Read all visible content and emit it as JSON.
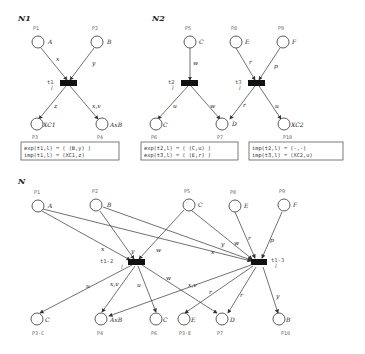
{
  "nets": {
    "n1": {
      "title": "N1",
      "places": {
        "p1": {
          "id": "P1",
          "token": "A"
        },
        "p2": {
          "id": "P2",
          "token": "B"
        },
        "p3": {
          "id": "P3",
          "token": "XC1"
        },
        "p4": {
          "id": "P4",
          "token": "AxB"
        }
      },
      "transition": {
        "id": "t1",
        "sub": "l"
      },
      "arcs": {
        "p1_t1": "x",
        "p2_t1": "y",
        "t1_p3": "z",
        "t1_p4": "x,v"
      },
      "box": {
        "line1": "exp(t1,l) = ( (B,y) )",
        "line2": "imp(t1,l) = (XC1,z)"
      }
    },
    "n2": {
      "title": "N2",
      "places": {
        "p5": {
          "id": "P5",
          "token": "C"
        },
        "p8": {
          "id": "P8",
          "token": "E"
        },
        "p9": {
          "id": "P9",
          "token": "F"
        },
        "p6": {
          "id": "P6",
          "token": "C"
        },
        "p7": {
          "id": "P7",
          "token": "D"
        },
        "p10": {
          "id": "P10",
          "token": "XC2"
        }
      },
      "transitions": {
        "t2": {
          "id": "t2",
          "sub": "l"
        },
        "t3": {
          "id": "t3",
          "sub": "l"
        }
      },
      "arcs": {
        "p5_t2": "w",
        "t2_p6": "u",
        "t2_p7": "w",
        "p8_t3": "r",
        "p9_t3": "p",
        "t3_p7": "r",
        "t3_p10": "u"
      },
      "box_left": {
        "line1": "exp(t2,l) = ( (C,u) )",
        "line2": "exp(t3,l) = ( (E,r) )"
      },
      "box_right": {
        "line1": "imp(t2,l) = (-,-)",
        "line2": "imp(t3,l) = (XC2,u)"
      }
    },
    "n": {
      "title": "N",
      "places": {
        "p1": {
          "id": "P1",
          "token": "A"
        },
        "p2": {
          "id": "P2",
          "token": "B"
        },
        "p5": {
          "id": "P5",
          "token": "C"
        },
        "p8": {
          "id": "P8",
          "token": "E"
        },
        "p9": {
          "id": "P9",
          "token": "F"
        },
        "p3c": {
          "id": "P3-C",
          "token": "C"
        },
        "p4": {
          "id": "P4",
          "token": "AxB"
        },
        "p6": {
          "id": "P6",
          "token": "C"
        },
        "p3e": {
          "id": "P3-E",
          "token": "E"
        },
        "p7": {
          "id": "P7",
          "token": "D"
        },
        "p10": {
          "id": "P10",
          "token": "B"
        }
      },
      "transitions": {
        "t12": {
          "id": "t1-2",
          "sub": "l"
        },
        "t13": {
          "id": "t1-3",
          "sub": "l"
        }
      },
      "arcs": {
        "p1_t12": "x",
        "p2_t12": "y",
        "p5_t12": "w",
        "p1_t13": "x",
        "p2_t13": "y",
        "p5_t13": "w",
        "p8_t13": "r",
        "p9_t13": "p",
        "t12_p3c": "u",
        "t12_p4": "x,v",
        "t12_p6": "u",
        "t12_p7": "w",
        "t13_p4": "x,v",
        "t13_p3e": "r",
        "t13_p7": "r",
        "t13_p10": "y"
      }
    }
  }
}
